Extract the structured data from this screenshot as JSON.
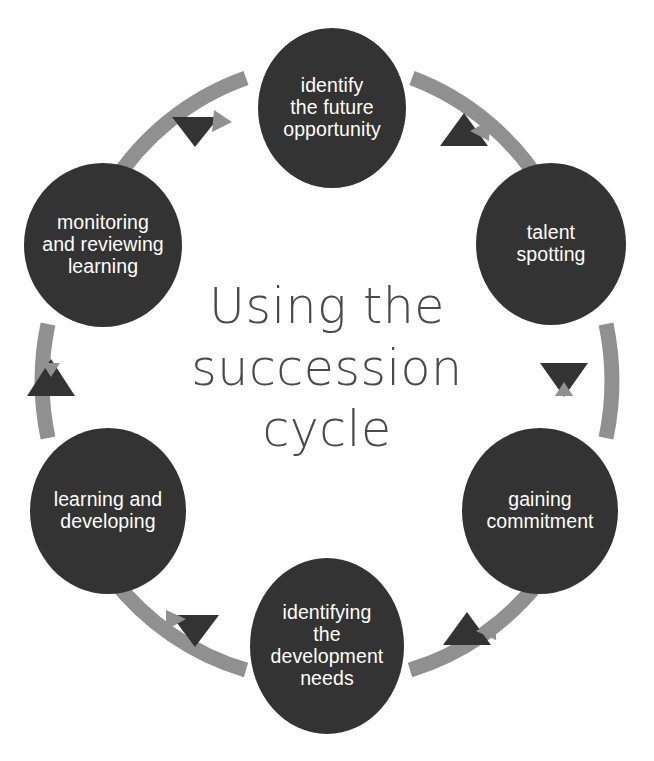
{
  "diagram": {
    "title_lines": [
      "Using the",
      "succession",
      "cycle"
    ],
    "title_text": "Using the succession cycle",
    "colors": {
      "node_fill": "#333333",
      "node_text": "#ffffff",
      "ring": "#909090",
      "arrowhead": "#333333",
      "title_text": "#4a4a4a",
      "background": "#ffffff"
    },
    "flow": "counterclockwise",
    "nodes": [
      {
        "id": "identify-the-future-opportunity",
        "label": "identify the future opportunity",
        "lines": [
          "identify",
          "the future",
          "opportunity"
        ],
        "position": "top"
      },
      {
        "id": "talent-spotting",
        "label": "talent spotting",
        "lines": [
          "talent",
          "spotting"
        ],
        "position": "upper-right"
      },
      {
        "id": "gaining-commitment",
        "label": "gaining commitment",
        "lines": [
          "gaining",
          "commitment"
        ],
        "position": "lower-right"
      },
      {
        "id": "identifying-the-development-needs",
        "label": "identifying the development needs",
        "lines": [
          "identifying",
          "the",
          "development",
          "needs"
        ],
        "position": "bottom"
      },
      {
        "id": "learning-and-developing",
        "label": "learning and developing",
        "lines": [
          "learning and",
          "developing"
        ],
        "position": "lower-left"
      },
      {
        "id": "monitoring-and-reviewing-learning",
        "label": "monitoring and reviewing learning",
        "lines": [
          "monitoring",
          "and reviewing",
          "learning"
        ],
        "position": "upper-left"
      }
    ],
    "arrows": [
      {
        "id": "arrow-top-left",
        "from": "identify-the-future-opportunity",
        "to": "monitoring-and-reviewing-learning",
        "direction": "down-left"
      },
      {
        "id": "arrow-left",
        "from": "monitoring-and-reviewing-learning",
        "to": "learning-and-developing",
        "direction": "up"
      },
      {
        "id": "arrow-bottom-left",
        "from": "learning-and-developing",
        "to": "identifying-the-development-needs",
        "direction": "down-right"
      },
      {
        "id": "arrow-bottom-right",
        "from": "identifying-the-development-needs",
        "to": "gaining-commitment",
        "direction": "up-right"
      },
      {
        "id": "arrow-right",
        "from": "gaining-commitment",
        "to": "talent-spotting",
        "direction": "down"
      },
      {
        "id": "arrow-top-right",
        "from": "talent-spotting",
        "to": "identify-the-future-opportunity",
        "direction": "up-left"
      }
    ]
  }
}
